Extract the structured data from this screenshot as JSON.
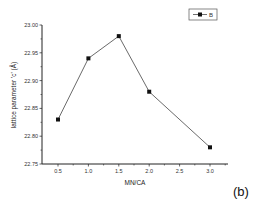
{
  "chart_data": {
    "type": "line",
    "title": "",
    "xlabel": "MN/CA",
    "ylabel": "lattice parameter 'c' (Å)",
    "x": [
      0.5,
      1.0,
      1.5,
      2.0,
      3.0
    ],
    "series": [
      {
        "name": "B",
        "values": [
          22.83,
          22.94,
          22.98,
          22.88,
          22.78
        ],
        "marker": "square",
        "color": "#333333"
      }
    ],
    "xlim": [
      0.3,
      3.2
    ],
    "ylim": [
      22.75,
      23.0
    ],
    "xticks": [
      "0.5",
      "1.0",
      "1.5",
      "2.0",
      "2.5",
      "3.0"
    ],
    "yticks": [
      "22.75",
      "22.80",
      "22.85",
      "22.90",
      "22.95",
      "23.00"
    ],
    "grid": false,
    "legend_position": "top-right",
    "annotation": "(b)"
  },
  "legend": {
    "label": "B"
  },
  "panel_label": "(b)",
  "axes": {
    "xlabel": "MN/CA",
    "ylabel": "lattice parameter 'c' (Å)"
  }
}
